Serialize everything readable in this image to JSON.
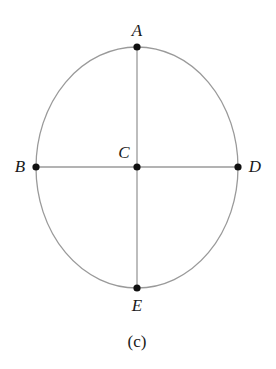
{
  "figure": {
    "caption": "(c)",
    "caption_position": {
      "x": 137,
      "y": 341
    },
    "canvas": {
      "width": 276,
      "height": 369,
      "background": "#ffffff"
    }
  },
  "diagram": {
    "type": "ellipse-with-axes",
    "stroke_color": "#9a9a9a",
    "line_color": "#9a9a9a",
    "point_color": "#111111",
    "stroke_width": 1.3,
    "ellipse": {
      "center_x": 137,
      "center_y": 167.5,
      "radius_x": 101,
      "radius_y": 120.5
    },
    "segments": [
      {
        "name": "vertical-axis-AE",
        "x1": 137,
        "y1": 47,
        "x2": 137,
        "y2": 288
      },
      {
        "name": "horizontal-axis-BD",
        "x1": 36,
        "y1": 167,
        "x2": 238,
        "y2": 167
      }
    ],
    "points": [
      {
        "id": "A",
        "label": "A",
        "cx": 137,
        "cy": 47,
        "r": 3.6,
        "label_x": 137,
        "label_y": 30
      },
      {
        "id": "B",
        "label": "B",
        "cx": 36,
        "cy": 167,
        "r": 3.6,
        "label_x": 20,
        "label_y": 166
      },
      {
        "id": "C",
        "label": "C",
        "cx": 137,
        "cy": 167,
        "r": 3.6,
        "label_x": 124,
        "label_y": 152
      },
      {
        "id": "D",
        "label": "D",
        "cx": 238,
        "cy": 167,
        "r": 3.6,
        "label_x": 255,
        "label_y": 166
      },
      {
        "id": "E",
        "label": "E",
        "cx": 137,
        "cy": 288,
        "r": 3.6,
        "label_x": 137,
        "label_y": 305
      }
    ]
  }
}
